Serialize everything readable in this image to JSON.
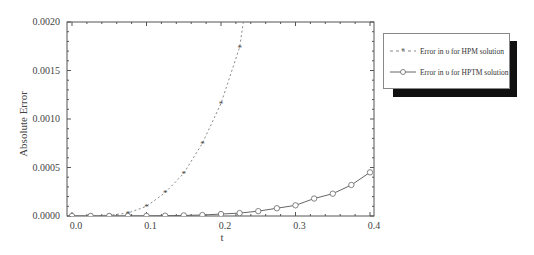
{
  "chart_data": {
    "type": "line",
    "title": "",
    "xlabel": "t",
    "ylabel": "Absolute Error",
    "xlim": [
      0.0,
      0.4
    ],
    "ylim": [
      0.0,
      0.002
    ],
    "x_ticks": [
      "0.0",
      "0.1",
      "0.2",
      "0.3",
      "0.4"
    ],
    "y_ticks": [
      "0.0000",
      "0.0005",
      "0.0010",
      "0.0015",
      "0.0020"
    ],
    "grid": false,
    "legend_position": "upper right, outside plot",
    "series": [
      {
        "name": "Error in υ for HPM solution",
        "style": "dashed",
        "marker": "star",
        "color": "#888888",
        "x": [
          0.0,
          0.025,
          0.05,
          0.075,
          0.1,
          0.125,
          0.15,
          0.175,
          0.2,
          0.225,
          0.23
        ],
        "y": [
          0.0,
          2e-06,
          8e-06,
          3e-05,
          0.0001,
          0.00024,
          0.00044,
          0.00075,
          0.00116,
          0.00174,
          0.002
        ]
      },
      {
        "name": "Error in υ for HPTM solution",
        "style": "solid",
        "marker": "circle",
        "color": "#666666",
        "x": [
          0.0,
          0.025,
          0.05,
          0.075,
          0.1,
          0.125,
          0.15,
          0.175,
          0.2,
          0.225,
          0.25,
          0.275,
          0.3,
          0.325,
          0.35,
          0.375,
          0.4
        ],
        "y": [
          0.0,
          0.0,
          0.0,
          0.0,
          1e-06,
          3e-06,
          6e-06,
          1e-05,
          2e-05,
          3e-05,
          5e-05,
          8e-05,
          0.00011,
          0.00018,
          0.00023,
          0.00032,
          0.00045
        ]
      }
    ]
  },
  "legend": {
    "items": [
      {
        "label": "Error in υ for HPM solution"
      },
      {
        "label": "Error in υ for HPTM solution"
      }
    ]
  }
}
